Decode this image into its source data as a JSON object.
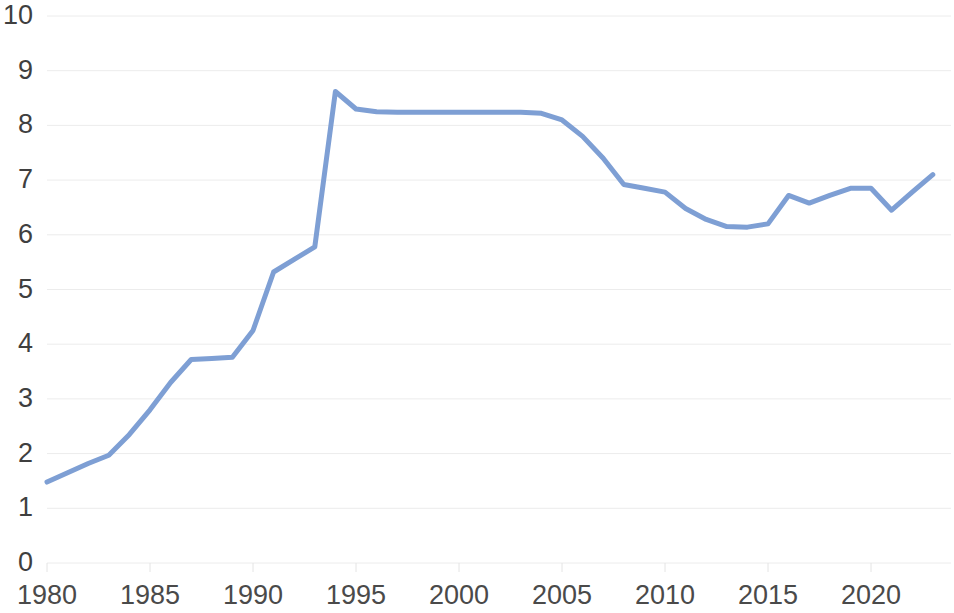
{
  "chart_data": {
    "type": "line",
    "title": "",
    "subtitle": "",
    "xlabel": "",
    "ylabel": "",
    "xlim": [
      1980,
      2023.8
    ],
    "ylim": [
      0,
      10
    ],
    "grid": true,
    "grid_axis": "y",
    "legend": "none",
    "line_color": "#7e9fd4",
    "line_width": 5,
    "y_ticks": [
      10,
      9,
      8,
      7,
      6,
      5,
      4,
      3,
      2,
      1,
      0
    ],
    "x_ticks": [
      1980,
      1985,
      1990,
      1995,
      2000,
      2005,
      2010,
      2015,
      2020
    ],
    "y_tick_labels": [
      "10",
      "9",
      "8",
      "7",
      "6",
      "5",
      "4",
      "3",
      "2",
      "1",
      "0"
    ],
    "x_tick_labels": [
      "1980",
      "1985",
      "1990",
      "1995",
      "2000",
      "2005",
      "2010",
      "2015",
      "2020"
    ],
    "series": [
      {
        "name": "Series 1",
        "color": "#7e9fd4",
        "x": [
          1980,
          1981,
          1982,
          1983,
          1984,
          1985,
          1986,
          1987,
          1988,
          1989,
          1990,
          1991,
          1992,
          1993,
          1994,
          1995,
          1996,
          1997,
          1998,
          1999,
          2000,
          2001,
          2002,
          2003,
          2004,
          2005,
          2006,
          2007,
          2008,
          2009,
          2010,
          2011,
          2012,
          2013,
          2014,
          2015,
          2016,
          2017,
          2018,
          2019,
          2020,
          2021,
          2022,
          2023
        ],
        "values": [
          1.48,
          1.65,
          1.82,
          1.97,
          2.35,
          2.8,
          3.3,
          3.72,
          3.74,
          3.76,
          4.25,
          5.32,
          5.55,
          5.78,
          8.62,
          8.3,
          8.25,
          8.24,
          8.24,
          8.24,
          8.24,
          8.24,
          8.24,
          8.24,
          8.22,
          8.1,
          7.8,
          7.4,
          6.92,
          6.85,
          6.78,
          6.48,
          6.28,
          6.15,
          6.14,
          6.2,
          6.72,
          6.58,
          6.72,
          6.85,
          6.85,
          6.45,
          6.78,
          7.1
        ]
      }
    ]
  },
  "axis": {
    "y_label_x_right": 33,
    "x_label_y_top": 582
  }
}
